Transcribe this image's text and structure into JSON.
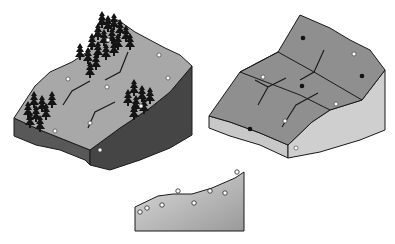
{
  "diagram": {
    "type": "terrain-block-diagrams",
    "panels": [
      {
        "id": "forested-block",
        "description": "Isometric terrain block with conifer tree clusters, gullies and sample points"
      },
      {
        "id": "gridded-block",
        "description": "Isometric terrain block divided into grid cells with drainage lines, filled and open sample points"
      },
      {
        "id": "profile",
        "description": "Cross-section profile with open circle sample points along surface"
      }
    ],
    "colors": {
      "top_surface_left": "#a8a8a8",
      "side_dark": "#585858",
      "side_darker": "#3f3f3f",
      "top_surface_right": "#8f8f8f",
      "side_light": "#cfcfcf",
      "side_light_front": "#bdbdbd",
      "profile_top": "#d8d8d8",
      "profile_bottom": "#a0a0a0",
      "outline": "#1a1a1a",
      "tree": "#141414"
    }
  }
}
